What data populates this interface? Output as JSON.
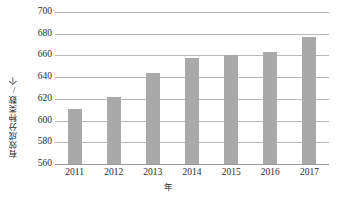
{
  "chart_data": {
    "type": "bar",
    "title": "",
    "subtitle": "",
    "xlabel": "年",
    "ylabel": "有效成分种类数/个",
    "categories": [
      "2011",
      "2012",
      "2013",
      "2014",
      "2015",
      "2016",
      "2017"
    ],
    "values": [
      611,
      622,
      644,
      658,
      660,
      663,
      677
    ],
    "series": [
      {
        "name": "有效成分种类数",
        "values": [
          611,
          622,
          644,
          658,
          660,
          663,
          677
        ]
      }
    ],
    "ylim": [
      560,
      700
    ],
    "ytick_step": 20,
    "yticks": [
      560,
      580,
      600,
      620,
      640,
      660,
      680,
      700
    ],
    "ytick_labels": [
      "560",
      "580",
      "600",
      "620",
      "640",
      "660",
      "680",
      "700"
    ],
    "xticks": [
      "2011",
      "2012",
      "2013",
      "2014",
      "2015",
      "2016",
      "2017"
    ],
    "grid": "horizontal",
    "legend": "none",
    "bar_color": "#a9a9a9",
    "gridline_color": "#b9b9b9",
    "axis_color": "#9a9a9a",
    "background_color": "#ffffff",
    "text_color": "#2b2b2b"
  }
}
